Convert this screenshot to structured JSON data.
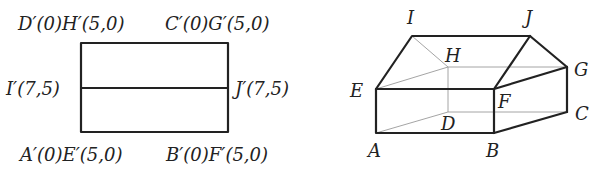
{
  "left_figure": {
    "labels": {
      "top_left": "D′(0)H′(5,0)",
      "top_right": "C′(0)G′(5,0)",
      "mid_left": "I′(7,5)",
      "mid_right": "J′(7,5)",
      "bottom_left": "A′(0)E′(5,0)",
      "bottom_right": "B′(0)F′(5,0)"
    }
  },
  "right_figure": {
    "labels": {
      "I": "I",
      "J": "J",
      "H": "H",
      "G": "G",
      "E": "E",
      "F": "F",
      "D": "D",
      "C": "C",
      "A": "A",
      "B": "B"
    }
  }
}
